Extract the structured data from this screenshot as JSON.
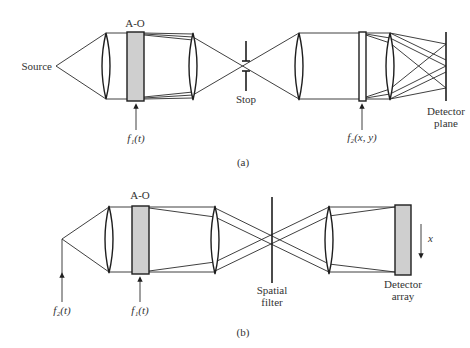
{
  "diagram_a": {
    "caption": "(a)",
    "labels": {
      "source": "Source",
      "acousto_optic": "A-O",
      "stop": "Stop",
      "f1": "f₁(t)",
      "f2": "f₂(x, y)",
      "detector_line1": "Detector",
      "detector_line2": "plane"
    }
  },
  "diagram_b": {
    "caption": "(b)",
    "labels": {
      "acousto_optic": "A-O",
      "f1": "f₁(t)",
      "f2": "f₂(t)",
      "spatial_filter_line1": "Spatial",
      "spatial_filter_line2": "filter",
      "detector_line1": "Detector",
      "detector_line2": "array",
      "scan_axis": "x"
    }
  },
  "colors": {
    "line": "#1e1e1e",
    "component_fill": "#cfcfcf",
    "background": "#ffffff"
  }
}
